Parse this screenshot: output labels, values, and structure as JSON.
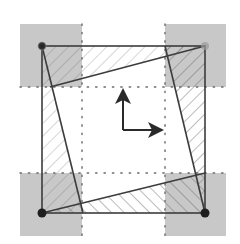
{
  "diagram": {
    "title": "",
    "colors": {
      "background": "#ffffff",
      "corner_fill": "#c8c8c8",
      "line": "#3c3c3c",
      "hatch": "#5a5a5a",
      "dot": "#2a2a2a",
      "grid_dot": "#6a6a6a"
    },
    "outer_square": {
      "x1": 42,
      "y1": 46,
      "x2": 205,
      "y2": 213
    },
    "corner_regions": [
      {
        "name": "top-left",
        "x": 20,
        "y": 24,
        "w": 62,
        "h": 63
      },
      {
        "name": "top-right",
        "x": 165,
        "y": 24,
        "w": 61,
        "h": 63
      },
      {
        "name": "bottom-left",
        "x": 20,
        "y": 173,
        "w": 62,
        "h": 63
      },
      {
        "name": "bottom-right",
        "x": 165,
        "y": 173,
        "w": 61,
        "h": 63
      }
    ],
    "grid_lines": {
      "vertical_x": [
        82,
        165
      ],
      "horizontal_y": [
        87,
        173
      ]
    },
    "corner_points": [
      {
        "name": "top-left",
        "x": 42,
        "y": 46
      },
      {
        "name": "top-right",
        "x": 205,
        "y": 46
      },
      {
        "name": "bottom-left",
        "x": 42,
        "y": 213
      },
      {
        "name": "bottom-right",
        "x": 205,
        "y": 213
      }
    ],
    "rotated_edges": [
      {
        "name": "left",
        "x1": 42,
        "y1": 46,
        "x2": 83,
        "y2": 213
      },
      {
        "name": "top",
        "x1": 50,
        "y1": 87,
        "x2": 205,
        "y2": 46
      },
      {
        "name": "right",
        "x1": 165,
        "y1": 46,
        "x2": 205,
        "y2": 213
      },
      {
        "name": "bottom",
        "x1": 42,
        "y1": 213,
        "x2": 205,
        "y2": 173
      }
    ],
    "axes_arrows": {
      "origin": {
        "x": 123,
        "y": 130
      },
      "up_tip": {
        "x": 123,
        "y": 88
      },
      "right_tip": {
        "x": 164,
        "y": 130
      }
    }
  }
}
